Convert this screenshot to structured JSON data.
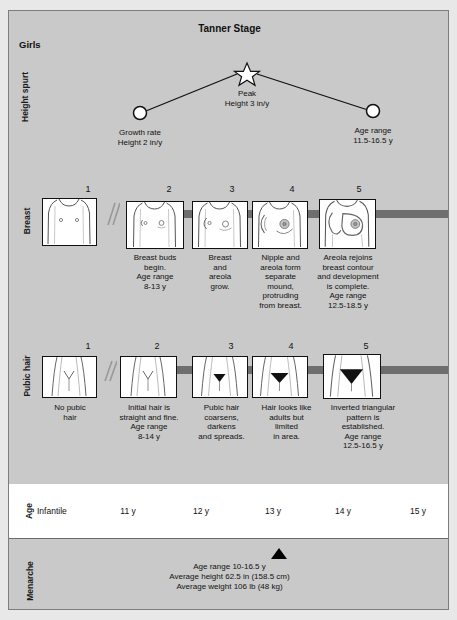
{
  "header": {
    "title": "Tanner Stage",
    "subject": "Girls"
  },
  "height_spurt": {
    "row_label": "Height\nspurt",
    "peak": {
      "label": "Peak\nHeight 3 in/y",
      "marker": "star-marker"
    },
    "start": {
      "label": "Growth rate\nHeight 2 in/y",
      "marker": "circle-marker"
    },
    "end": {
      "label": "Age range\n11.5-16.5 y",
      "marker": "circle-marker"
    }
  },
  "breast": {
    "row_label": "Breast",
    "stages": [
      {
        "number": "1",
        "caption": ""
      },
      {
        "number": "2",
        "caption": "Breast buds\nbegin.\nAge range\n8-13 y"
      },
      {
        "number": "3",
        "caption": "Breast\nand\nareola\ngrow."
      },
      {
        "number": "4",
        "caption": "Nipple and\nareola form\nseparate\nmound,\nprotruding\nfrom breast."
      },
      {
        "number": "5",
        "caption": "Areola rejoins\nbreast contour\nand development\nis complete.\nAge range\n12.5-18.5 y"
      }
    ]
  },
  "pubic_hair": {
    "row_label": "Pubic hair",
    "stages": [
      {
        "number": "1",
        "caption": "No pubic\nhair"
      },
      {
        "number": "2",
        "caption": "Initial hair is\nstraight and fine.\nAge range\n8-14 y"
      },
      {
        "number": "3",
        "caption": "Pubic hair\ncoarsens,\ndarkens\nand spreads."
      },
      {
        "number": "4",
        "caption": "Hair looks like\nadults but\nlimited\nin area."
      },
      {
        "number": "5",
        "caption": "Inverted triangular\npattern is\nestablished.\nAge range\n12.5-16.5 y"
      }
    ]
  },
  "age": {
    "row_label": "Age",
    "cells": [
      "Infantile",
      "11 y",
      "12 y",
      "13 y",
      "14 y",
      "15 y"
    ]
  },
  "menarche": {
    "row_label": "Menarche",
    "marker": "triangle-marker",
    "text": "Age range 10-16.5 y\nAverage height 62.5 in (158.5 cm)\nAverage weight 106 lb (48 kg)"
  },
  "colors": {
    "panel": "#c9c9c9",
    "band": "#6e6e6e",
    "box_fill": "#ffffff",
    "ink": "#111111"
  }
}
